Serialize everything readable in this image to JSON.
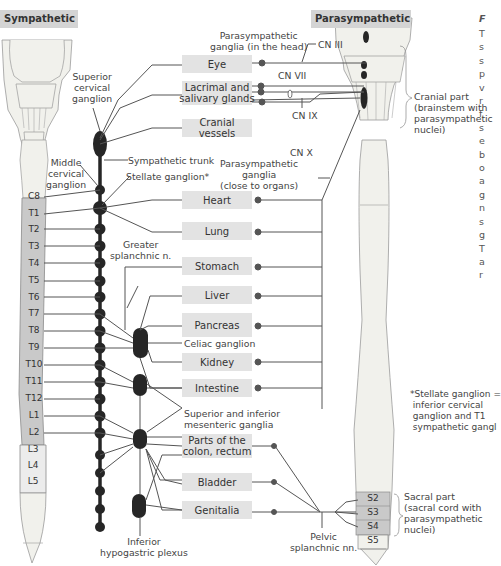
{
  "headers": {
    "sympathetic": "Sympathetic",
    "parasympathetic": "Parasympathetic"
  },
  "organs": [
    {
      "id": "eye",
      "label": "Eye"
    },
    {
      "id": "lacrimal",
      "label": "Lacrimal and\nsalivary glands"
    },
    {
      "id": "cranial-vessels",
      "label": "Cranial vessels"
    },
    {
      "id": "heart",
      "label": "Heart"
    },
    {
      "id": "lung",
      "label": "Lung"
    },
    {
      "id": "stomach",
      "label": "Stomach"
    },
    {
      "id": "liver",
      "label": "Liver"
    },
    {
      "id": "pancreas",
      "label": "Pancreas"
    },
    {
      "id": "kidney",
      "label": "Kidney"
    },
    {
      "id": "intestine",
      "label": "Intestine"
    },
    {
      "id": "colon",
      "label": "Parts of the\ncolon, rectum"
    },
    {
      "id": "bladder",
      "label": "Bladder"
    },
    {
      "id": "genitalia",
      "label": "Genitalia"
    }
  ],
  "sympathetic_segments": [
    "C8",
    "T1",
    "T2",
    "T3",
    "T4",
    "T5",
    "T6",
    "T7",
    "T8",
    "T9",
    "T10",
    "T11",
    "T12",
    "L1",
    "L2",
    "L3",
    "L4",
    "L5"
  ],
  "parasympathetic_segments": [
    "S2",
    "S3",
    "S4",
    "S5"
  ],
  "labels": {
    "superior_cervical_ganglion": "Superior\ncervical\nganglion",
    "middle_cervical_ganglion": "Middle\ncervical\nganglion",
    "sympathetic_trunk": "Sympathetic trunk",
    "stellate_ganglion": "Stellate ganglion*",
    "greater_splanchnic": "Greater\nsplanchnic n.",
    "celiac_ganglion": "Celiac ganglion",
    "mesenteric_ganglia": "Superior and inferior\nmesenteric ganglia",
    "inferior_hypogastric": "Inferior\nhypogastric plexus",
    "pelvic_splanchnic": "Pelvic\nsplanchnic nn.",
    "parasym_ganglia_head": "Parasympathetic\nganglia (in the head)",
    "parasym_ganglia_organs": "Parasympathetic\nganglia\n(close to organs)",
    "cn3": "CN III",
    "cn7": "CN VII",
    "cn9": "CN IX",
    "cn10": "CN X",
    "cranial_part": "Cranial part\n(brainstem with\nparasympathetic\nnuclei)",
    "sacral_part": "Sacral part\n(sacral cord with\nparasympathetic\nnuclei)"
  },
  "footnote": "*Stellate ganglion =\n inferior cervical\n ganglion and T1\n sympathetic gangl",
  "side_text": {
    "heading": "F",
    "lines": [
      "T",
      "s",
      "s",
      "p",
      "v",
      "r",
      "f",
      "s",
      "e",
      "b",
      "o",
      "a",
      "g",
      "n",
      "s",
      "g",
      "T",
      "a",
      "r"
    ]
  },
  "colors": {
    "organ_box": "#e3e3e3",
    "header_bg": "#d4d4d4",
    "segment_active": "#c9c9c9",
    "cord_fill": "#f1f1ec",
    "ganglion": "#262626",
    "line": "#555555"
  }
}
